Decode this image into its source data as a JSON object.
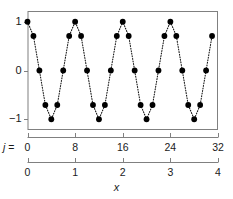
{
  "chart_data": {
    "type": "scatter",
    "title": "",
    "subtitle": "",
    "xlabel": "x",
    "ylabel": "",
    "secondary_xlabel": "j =",
    "grid": false,
    "legend": null,
    "marker": "filled-circle",
    "line_style": "dotted",
    "line_color": "#1a1a1a",
    "marker_color": "#000000",
    "frame_color": "#808080",
    "background": "#ffffff",
    "xlim": [
      0,
      32
    ],
    "ylim": [
      -1.22,
      1.22
    ],
    "y_ticks": [
      1,
      0,
      -1
    ],
    "y_tick_labels": [
      "1",
      "0",
      "−1"
    ],
    "j_axis": {
      "label": "j =",
      "lim": [
        0,
        32
      ],
      "ticks": [
        0,
        8,
        16,
        24,
        32
      ],
      "tick_labels": [
        "0",
        "8",
        "16",
        "24",
        "32"
      ]
    },
    "x_axis": {
      "label": "x",
      "lim": [
        0,
        4
      ],
      "ticks": [
        0,
        1,
        2,
        3,
        4
      ],
      "tick_labels": [
        "0",
        "1",
        "2",
        "3",
        "4"
      ]
    },
    "j": [
      0,
      1,
      2,
      3,
      4,
      5,
      6,
      7,
      8,
      9,
      10,
      11,
      12,
      13,
      14,
      15,
      16,
      17,
      18,
      19,
      20,
      21,
      22,
      23,
      24,
      25,
      26,
      27,
      28,
      29,
      30,
      31
    ],
    "x": [
      0,
      0.125,
      0.25,
      0.375,
      0.5,
      0.625,
      0.75,
      0.875,
      1,
      1.125,
      1.25,
      1.375,
      1.5,
      1.625,
      1.75,
      1.875,
      2,
      2.125,
      2.25,
      2.375,
      2.5,
      2.625,
      2.75,
      2.875,
      3,
      3.125,
      3.25,
      3.375,
      3.5,
      3.625,
      3.75,
      3.875
    ],
    "values": [
      1,
      0.707,
      0,
      -0.707,
      -1,
      -0.707,
      0,
      0.707,
      1,
      0.707,
      0,
      -0.707,
      -1,
      -0.707,
      0,
      0.707,
      1,
      0.707,
      0,
      -0.707,
      -1,
      -0.707,
      0,
      0.707,
      1,
      0.707,
      0,
      -0.707,
      -1,
      -0.707,
      0,
      0.707
    ]
  }
}
